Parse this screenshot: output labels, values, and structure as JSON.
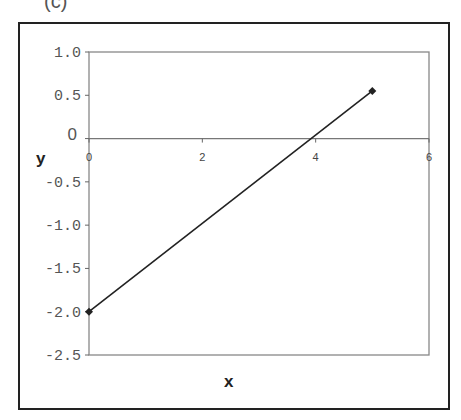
{
  "panel_label": "(c)",
  "chart_data": {
    "type": "line",
    "title": "",
    "xlabel": "x",
    "ylabel": "y",
    "xlim": [
      0,
      6
    ],
    "ylim": [
      -2.5,
      1.0
    ],
    "x_ticks": [
      "0",
      "2",
      "4",
      "6"
    ],
    "y_ticks": [
      "1.0",
      "0.5",
      "0",
      "-0.5",
      "-1.0",
      "-1.5",
      "-2.0",
      "-2.5"
    ],
    "grid": false,
    "legend": null,
    "series": [
      {
        "name": "y",
        "x": [
          0,
          5
        ],
        "values": [
          -2.0,
          0.55
        ],
        "marker": "diamond",
        "color": "#222222"
      }
    ]
  }
}
